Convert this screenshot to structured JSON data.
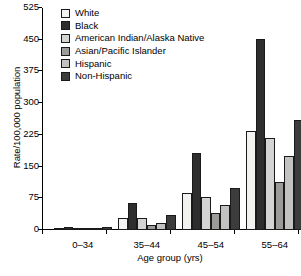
{
  "chart_data": {
    "type": "bar",
    "title": "",
    "xlabel": "Age group (yrs)",
    "ylabel": "Rate/100,000 population",
    "categories": [
      "0–34",
      "35–44",
      "45–54",
      "55–64"
    ],
    "ylim": [
      0,
      525
    ],
    "yticks": [
      0,
      75,
      150,
      225,
      300,
      375,
      450,
      525
    ],
    "ytick_labels": [
      "0",
      "75",
      "150",
      "225",
      "300",
      "375",
      "450",
      "525"
    ],
    "grid": false,
    "legend_position": "top-left",
    "series": [
      {
        "name": "White",
        "color": "#f2f2f0",
        "values": [
          3,
          28,
          88,
          233
        ]
      },
      {
        "name": "Black",
        "color": "#2e2e2e",
        "values": [
          7,
          63,
          182,
          451
        ]
      },
      {
        "name": "American Indian/Alaska Native",
        "color": "#d4d4d2",
        "values": [
          3,
          29,
          79,
          218
        ]
      },
      {
        "name": "Asian/Pacific Islander",
        "color": "#9b9b99",
        "values": [
          2,
          13,
          40,
          113
        ]
      },
      {
        "name": "Hispanic",
        "color": "#c2c2c0",
        "values": [
          3,
          17,
          60,
          176
        ]
      },
      {
        "name": "Non-Hispanic",
        "color": "#3c3c3c",
        "values": [
          6,
          35,
          99,
          259
        ]
      }
    ]
  }
}
